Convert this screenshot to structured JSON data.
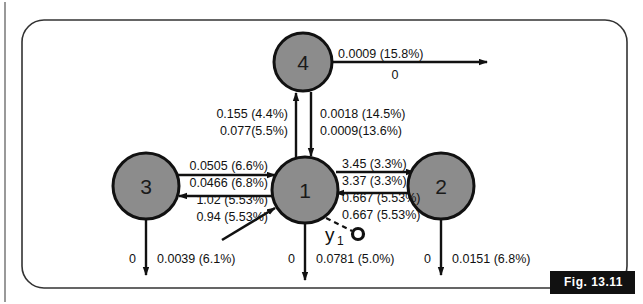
{
  "figure": {
    "caption": "Fig. 13.11",
    "border_color": "#333333",
    "node_fill": "#8c8c8c",
    "node_stroke": "#111111",
    "line_color": "#111111"
  },
  "nodes": [
    {
      "id": "node-1",
      "label": "1",
      "cx": 305,
      "cy": 190,
      "r": 33
    },
    {
      "id": "node-2",
      "label": "2",
      "cx": 441,
      "cy": 186,
      "r": 33
    },
    {
      "id": "node-3",
      "label": "3",
      "cx": 146,
      "cy": 186,
      "r": 33
    },
    {
      "id": "node-4",
      "label": "4",
      "cx": 303,
      "cy": 62,
      "r": 29
    }
  ],
  "edges": {
    "node4_out_right": {
      "top": "0.0009 (15.8%)",
      "bottom": "0"
    },
    "node1_to_node4": {
      "top": "0.155 (4.4%)",
      "bottom": "0.077(5.5%)"
    },
    "node4_to_node1": {
      "top": "0.0018 (14.5%)",
      "bottom": "0.0009(13.6%)"
    },
    "node3_to_node1": {
      "top": "0.0505 (6.6%)",
      "bottom": "0.0466 (6.8%)"
    },
    "node1_to_node3": {
      "top": "1.02 (5.53%)",
      "bottom": "0.94 (5.53%)"
    },
    "node1_to_node2": {
      "top": "3.45 (3.3%)",
      "bottom": "3.37 (3.3%)"
    },
    "node2_to_node1": {
      "top": "0.667 (5.53%)",
      "bottom": "0.667 (5.53%)"
    },
    "node3_out_down": {
      "left": "0",
      "right": "0.0039 (6.1%)"
    },
    "node1_out_down": {
      "left": "0",
      "right": "0.0781 (5.0%)"
    },
    "node2_out_down": {
      "left": "0",
      "right": "0.0151 (6.8%)"
    }
  },
  "annotations": {
    "y_label": "y",
    "y_subscript": "1"
  }
}
